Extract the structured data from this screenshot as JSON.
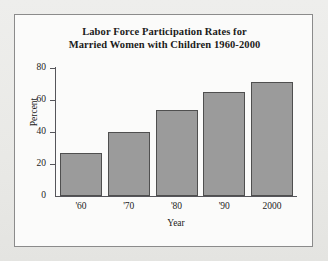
{
  "figure": {
    "title_line1": "Labor Force Participation Rates for",
    "title_line2": "Married Women with Children 1960-2000",
    "frame_color": "#8b8b8b",
    "background_color": "#fbfbfa",
    "page_background_color": "#ececea"
  },
  "chart_data": {
    "type": "bar",
    "title": "Labor Force Participation Rates for Married Women with Children 1960-2000",
    "categories": [
      "'60",
      "'70",
      "'80",
      "'90",
      "2000"
    ],
    "values": [
      27,
      40,
      54,
      65,
      71
    ],
    "xlabel": "Year",
    "ylabel": "Percent",
    "ylim": [
      0,
      80
    ],
    "yticks": [
      0,
      20,
      40,
      60,
      80
    ],
    "ytick_labels": [
      "0",
      "20",
      "40",
      "60",
      "80"
    ],
    "grid": false,
    "legend": false,
    "bar_fill_color": "#9b9b9b",
    "bar_edge_color": "#4f4f4f",
    "axis_color": "#55555a"
  }
}
